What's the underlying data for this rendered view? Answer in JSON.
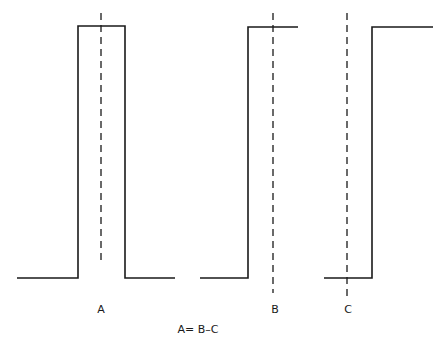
{
  "diagram": {
    "pulses": [
      {
        "id": "A",
        "label": "A",
        "description": "full pulse",
        "points": "17,278 78,278 78,26 125,26 125,278 175,278",
        "dash": {
          "x": 101,
          "y1": 13,
          "y2": 262
        },
        "label_pos": {
          "x": 101,
          "y": 313
        }
      },
      {
        "id": "B",
        "label": "B",
        "description": "rising step",
        "points": "200,278 248,278 248,27 298,27",
        "dash": {
          "x": 273,
          "y1": 13,
          "y2": 293
        },
        "label_pos": {
          "x": 275,
          "y": 313
        }
      },
      {
        "id": "C",
        "label": "C",
        "description": "delayed rising step",
        "points": "324,278 372,278 372,27 433,27",
        "dash": {
          "x": 347,
          "y1": 13,
          "y2": 300
        },
        "label_pos": {
          "x": 348,
          "y": 313
        }
      }
    ],
    "equation": "A= B–C",
    "equation_pos": {
      "x": 198,
      "y": 333
    }
  }
}
